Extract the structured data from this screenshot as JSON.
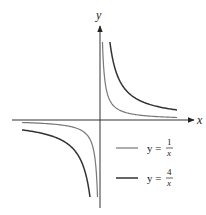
{
  "diagram": {
    "axes": {
      "x_label": "x",
      "y_label": "y",
      "axis_color": "#333333"
    },
    "curves": [
      {
        "name": "y = 1/x",
        "k": 1,
        "color": "#777777",
        "stroke_width": 1.2
      },
      {
        "name": "y = 4/x",
        "k": 4,
        "color": "#333333",
        "stroke_width": 1.5
      }
    ],
    "legend": [
      {
        "prefix": "y =",
        "numerator": "1",
        "denominator": "x",
        "color": "#777777"
      },
      {
        "prefix": "y =",
        "numerator": "4",
        "denominator": "x",
        "color": "#333333"
      }
    ]
  },
  "chart_data": {
    "type": "line",
    "title": "",
    "xlabel": "x",
    "ylabel": "y",
    "grid": false,
    "legend_position": "lower right",
    "xlim": [
      -6,
      6.5
    ],
    "ylim": [
      -6.5,
      6.5
    ],
    "series": [
      {
        "name": "y = 1/x",
        "x": [
          -5.6,
          -4,
          -2,
          -1,
          -0.5,
          -0.25,
          -0.2,
          0.2,
          0.25,
          0.5,
          1,
          2,
          4,
          5.5
        ],
        "y": [
          -0.18,
          -0.25,
          -0.5,
          -1,
          -2,
          -4,
          -5,
          5,
          4,
          2,
          1,
          0.5,
          0.25,
          0.18
        ]
      },
      {
        "name": "y = 4/x",
        "x": [
          -5.6,
          -4,
          -2,
          -1,
          -0.8,
          -0.7,
          0.7,
          0.8,
          1,
          2,
          4,
          5.5
        ],
        "y": [
          -0.71,
          -1,
          -2,
          -4,
          -5,
          -5.7,
          5.7,
          5,
          4,
          2,
          1,
          0.73
        ]
      }
    ]
  }
}
